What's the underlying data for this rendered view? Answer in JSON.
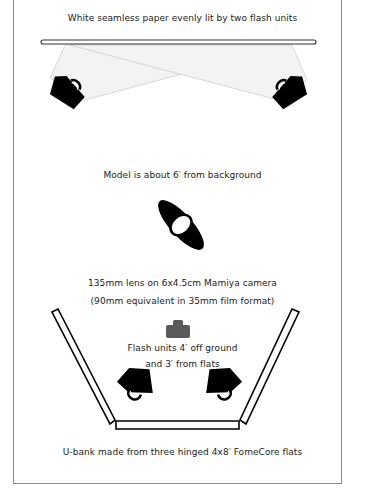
{
  "diagram": {
    "labels": {
      "background": "White seamless paper evenly lit by two flash units",
      "model": "Model is about 6′ from background",
      "camera_line1": "135mm lens on 6x4.5cm Mamiya camera",
      "camera_line2": "(90mm equivalent in 35mm film format)",
      "flash_line1": "Flash units 4′ off ground",
      "flash_line2": "and 3′ from flats",
      "ubank": "U-bank made from three hinged 4x8′ FomeCore flats"
    },
    "elements": [
      {
        "name": "seamless-paper-backdrop",
        "icon": "backdrop-bar-icon"
      },
      {
        "name": "background-flash-left",
        "icon": "flash-unit-icon"
      },
      {
        "name": "background-flash-right",
        "icon": "flash-unit-icon"
      },
      {
        "name": "model",
        "icon": "model-topview-icon"
      },
      {
        "name": "camera",
        "icon": "camera-icon"
      },
      {
        "name": "front-flash-left",
        "icon": "flash-unit-icon"
      },
      {
        "name": "front-flash-right",
        "icon": "flash-unit-icon"
      },
      {
        "name": "u-bank-flats",
        "icon": "fomecore-flat-icon",
        "count": 3
      }
    ],
    "colors": {
      "ink": "#000000",
      "frame": "#8a8a8a",
      "light_cone": "#f2f2f2",
      "camera": "#5a5a5a"
    }
  }
}
